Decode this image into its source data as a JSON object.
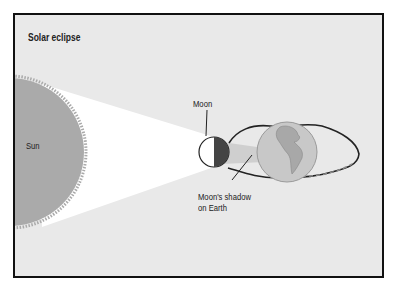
{
  "title": "Solar eclipse",
  "labels": {
    "sun": "Sun",
    "moon": "Moon",
    "shadow_line1": "Moon's shadow",
    "shadow_line2": "on Earth"
  },
  "colors": {
    "background": "#e9e9e9",
    "sun": "#aaaaaa",
    "light_cone": "#ffffff",
    "moon_dark": "#444444",
    "earth": "#c4c4c4",
    "frame": "#111111"
  }
}
